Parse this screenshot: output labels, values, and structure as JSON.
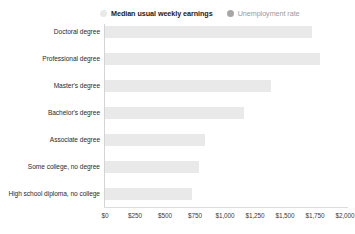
{
  "legend": {
    "position": "top",
    "items": [
      {
        "label": "Median usual weekly earnings",
        "marker": "circle-icon",
        "color": "#e9e9e9",
        "state": "active"
      },
      {
        "label": "Unemployment rate",
        "marker": "circle-icon",
        "color": "#a6a6a6",
        "state": "inactive"
      }
    ]
  },
  "chart_data": {
    "type": "bar",
    "orientation": "horizontal",
    "title": "",
    "xlabel": "",
    "ylabel": "",
    "xlim": [
      0,
      2000
    ],
    "grid": false,
    "legend_position": "top",
    "xticks": [
      0,
      250,
      500,
      750,
      1000,
      1250,
      1500,
      1750,
      2000
    ],
    "xtick_labels": [
      "$0",
      "$250",
      "$500",
      "$750",
      "$1,000",
      "$1,250",
      "$1,500",
      "$1,750",
      "$2,000"
    ],
    "categories": [
      "Doctoral degree",
      "Professional degree",
      "Master's degree",
      "Bachelor's degree",
      "Associate degree",
      "Some college, no degree",
      "High school diploma, no college"
    ],
    "series": [
      {
        "name": "Median usual weekly earnings",
        "color": "#e9e9e9",
        "values": [
          1700,
          1760,
          1360,
          1140,
          820,
          770,
          715
        ]
      }
    ]
  }
}
